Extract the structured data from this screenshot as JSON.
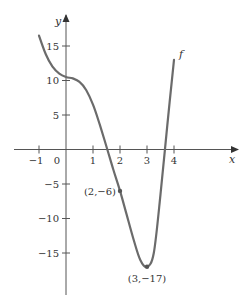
{
  "chart_data": {
    "type": "line",
    "title": "",
    "xlabel": "x",
    "ylabel": "y",
    "curve_label": "f",
    "xlim": [
      -1.3,
      6.3
    ],
    "ylim": [
      -21,
      19.5
    ],
    "grid": false,
    "x_ticks": [
      -1,
      0,
      1,
      2,
      3,
      4
    ],
    "x_tick_labels": [
      "−1",
      "0",
      "1",
      "2",
      "3",
      "4"
    ],
    "y_ticks": [
      15,
      10,
      5,
      -5,
      -10,
      -15
    ],
    "y_tick_labels": [
      "15",
      "10",
      "5",
      "−5",
      "−10",
      "−15"
    ],
    "series": [
      {
        "name": "f",
        "x": [
          -1,
          -0.75,
          -0.5,
          -0.25,
          0,
          0.25,
          0.5,
          0.75,
          1,
          1.25,
          1.5,
          1.75,
          2,
          2.25,
          2.5,
          2.75,
          3,
          3.25,
          3.5,
          3.75,
          4
        ],
        "y": [
          16.5,
          13.8,
          12.0,
          11.0,
          10.5,
          10.3,
          9.8,
          8.6,
          6.5,
          3.6,
          0.4,
          -2.9,
          -6.0,
          -9.5,
          -13.0,
          -16.0,
          -17.0,
          -15.0,
          -6.5,
          3.5,
          13.0
        ]
      }
    ],
    "annotations": [
      {
        "x": 2,
        "y": -6,
        "label": "(2,−6)"
      },
      {
        "x": 3,
        "y": -17,
        "label": "(3,−17)"
      }
    ],
    "colors": {
      "curve": "#6b6b6b",
      "axis": "#555555",
      "text": "#333333"
    }
  }
}
